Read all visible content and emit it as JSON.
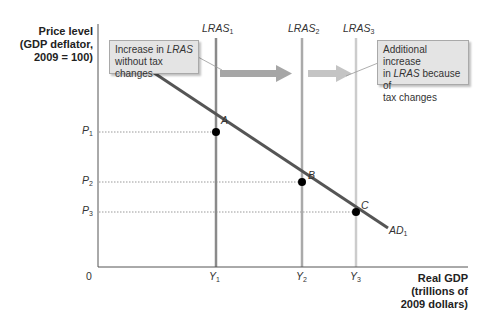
{
  "diagram": {
    "y_axis_title": [
      "Price level",
      "(GDP deflator,",
      "2009 = 100)"
    ],
    "x_axis_title": [
      "Real GDP",
      "(trillions of",
      "2009 dollars)"
    ],
    "origin_label": "0",
    "lras_curves": [
      {
        "name": "LRAS",
        "subscript": "1",
        "x_label": "Y",
        "x_sub": "1",
        "color": "#8a8a8a"
      },
      {
        "name": "LRAS",
        "subscript": "2",
        "x_label": "Y",
        "x_sub": "2",
        "color": "#aaaaaa"
      },
      {
        "name": "LRAS",
        "subscript": "3",
        "x_label": "Y",
        "x_sub": "3",
        "color": "#cccccc"
      }
    ],
    "price_levels": [
      {
        "label": "P",
        "sub": "1"
      },
      {
        "label": "P",
        "sub": "2"
      },
      {
        "label": "P",
        "sub": "3"
      }
    ],
    "points": [
      {
        "label": "A",
        "at": "Y1,P1"
      },
      {
        "label": "B",
        "at": "Y2,P2"
      },
      {
        "label": "C",
        "at": "Y3,P3"
      }
    ],
    "ad_curve": {
      "name": "AD",
      "subscript": "1",
      "color": "#555555"
    },
    "callouts": [
      {
        "line1_pre": "Increase in ",
        "line1_em": "LRAS",
        "line2": "without tax changes"
      },
      {
        "line1": "Additional increase",
        "line2_pre": "in ",
        "line2_em": "LRAS",
        "line2_post": " because of",
        "line3": "tax changes"
      }
    ],
    "arrows": [
      {
        "from": "LRAS1",
        "to": "LRAS2",
        "color": "#a6a6a6"
      },
      {
        "from": "LRAS2",
        "to": "LRAS3",
        "color": "#c4c4c4"
      }
    ]
  }
}
